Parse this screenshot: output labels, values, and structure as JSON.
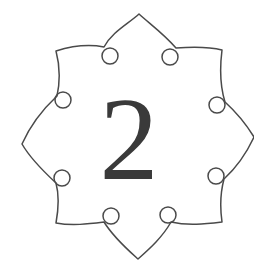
{
  "ornament": {
    "numeral": "2",
    "stroke_color": "#4a4a4a",
    "text_color": "#3a3a3a",
    "background": "#ffffff",
    "shape": "eight-point-ogee-flower-frame"
  }
}
